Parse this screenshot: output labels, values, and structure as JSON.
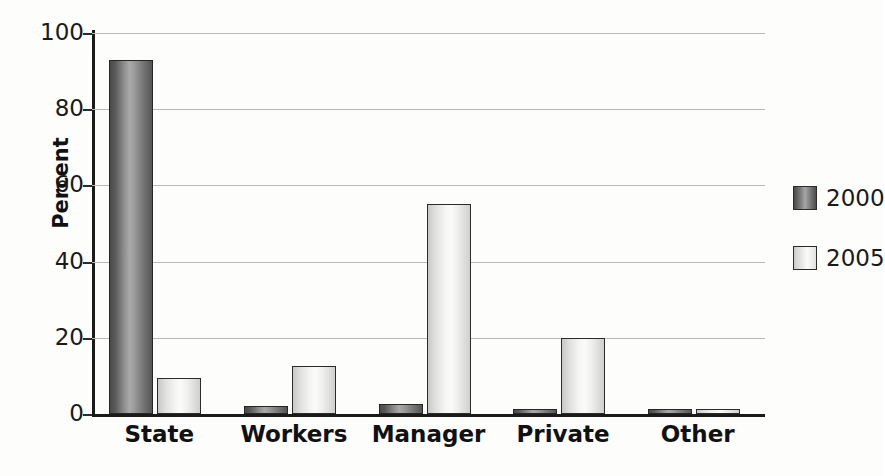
{
  "chart_data": {
    "type": "bar",
    "title": "",
    "subtitle": "",
    "xlabel": "",
    "ylabel": "Percent",
    "ylim": [
      0,
      100
    ],
    "ytick_labels": [
      "0",
      "20",
      "40",
      "60",
      "80",
      "100"
    ],
    "ytick_values": [
      0,
      20,
      40,
      60,
      80,
      100
    ],
    "grid": true,
    "grid_axis": "y",
    "legend_position": "right",
    "categories": [
      "State",
      "Workers",
      "Manager",
      "Private",
      "Other"
    ],
    "series": [
      {
        "name": "2000",
        "color": "#7d7d7d",
        "values": [
          93,
          2,
          2.5,
          0.7,
          1
        ]
      },
      {
        "name": "2005",
        "color": "#f0f0ee",
        "values": [
          9.5,
          12.5,
          55,
          20,
          1.2
        ]
      }
    ]
  },
  "legend": {
    "entries": [
      {
        "label": "2000",
        "swatch": "series-2000-swatch"
      },
      {
        "label": "2005",
        "swatch": "series-2005-swatch"
      }
    ]
  },
  "axis": {
    "y_title": "Percent"
  }
}
